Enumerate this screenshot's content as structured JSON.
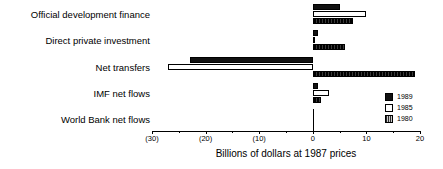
{
  "chart_data": {
    "type": "bar",
    "orientation": "horizontal",
    "title": "",
    "xlabel": "Billions of dollars at 1987 prices",
    "ylabel": "",
    "xlim": [
      -30,
      20
    ],
    "grid": false,
    "legend_position": "bottom-right",
    "categories": [
      "Official development finance",
      "Direct private investment",
      "Net transfers",
      "IMF net flows",
      "World Bank net flows"
    ],
    "series": [
      {
        "name": "1989",
        "color": "#111111",
        "values": [
          5.0,
          1.0,
          -23.0,
          1.0,
          0.0
        ]
      },
      {
        "name": "1985",
        "color": "#ffffff",
        "values": [
          10.0,
          0.2,
          -27.0,
          3.0,
          0.0
        ]
      },
      {
        "name": "1980",
        "color": "#1a1a1a",
        "values": [
          7.5,
          6.0,
          19.0,
          1.5,
          0.0
        ]
      }
    ],
    "xticks": [
      -30,
      -20,
      -10,
      0,
      10,
      20
    ],
    "xtick_labels": [
      "(30)",
      "(20)",
      "(10)",
      "0",
      "10",
      "20"
    ],
    "xtick_minor": [
      -25,
      -15,
      -5,
      5,
      15
    ]
  },
  "legend": {
    "items": [
      {
        "label": "1989",
        "style": "solid-black"
      },
      {
        "label": "1985",
        "style": "open-white"
      },
      {
        "label": "1980",
        "style": "hatched-gray"
      }
    ]
  }
}
